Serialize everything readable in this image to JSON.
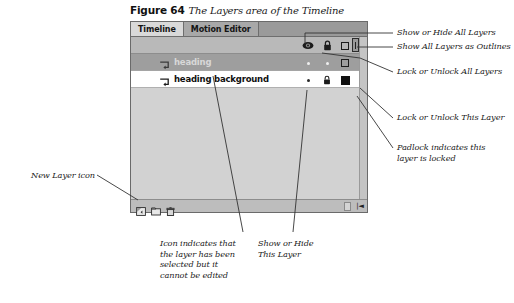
{
  "figure": {
    "number": "Figure 64",
    "title": "The Layers area of the Timeline"
  },
  "panel": {
    "tabs": [
      {
        "label": "Timeline",
        "active": true
      },
      {
        "label": "Motion Editor",
        "active": false
      }
    ],
    "header_icons": [
      {
        "name": "eye-icon",
        "title": "Show or Hide All Layers"
      },
      {
        "name": "lock-icon",
        "title": "Lock or Unlock All Layers"
      },
      {
        "name": "outline-square-icon",
        "title": "Show All Layers as Outlines"
      }
    ],
    "layers": [
      {
        "name": "heading",
        "selected": true,
        "locked": false,
        "visibility_marker": "dot",
        "lock_marker": "dot",
        "outline_marker": "outline-square",
        "row_icon": "selected-not-editable-icon"
      },
      {
        "name": "heading background",
        "selected": false,
        "locked": true,
        "visibility_marker": "dot",
        "lock_marker": "padlock",
        "outline_marker": "filled-square",
        "row_icon": "layer-icon"
      }
    ],
    "footer_buttons": [
      {
        "name": "new-layer-button",
        "label": "New Layer"
      },
      {
        "name": "new-folder-button",
        "label": "New Folder"
      },
      {
        "name": "delete-layer-button",
        "label": "Delete"
      }
    ]
  },
  "annotations": {
    "show_hide_all": "Show or Hide All Layers",
    "show_outlines_all": "Show All Layers as Outlines",
    "lock_unlock_all": "Lock or Unlock All Layers",
    "lock_unlock_this": "Lock or Unlock This Layer",
    "padlock_note": "Padlock indicates this\nlayer is locked",
    "new_layer_icon": "New Layer icon",
    "selected_note": "Icon indicates that\nthe layer has been\nselected but it\ncannot be edited",
    "show_hide_this": "Show or Hide\nThis Layer"
  },
  "colors": {
    "panel_bg": "#d2d2d2",
    "tab_active": "#d9d9d9",
    "tab_inactive": "#a8a8a8",
    "row_selected": "#9e9e9e",
    "row_normal": "#ffffff",
    "leader_line": "#333333"
  }
}
